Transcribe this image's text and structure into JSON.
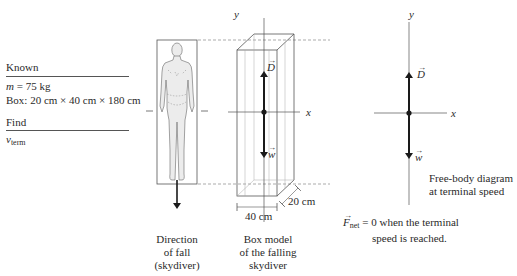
{
  "known_panel": {
    "heading": "Known",
    "mass_var": "m",
    "mass_value": " = 75 kg",
    "box_dims": "Box: 20 cm × 40 cm × 180 cm",
    "find_heading": "Find",
    "find_var": "v",
    "find_sub": "term"
  },
  "skydiver_figure": {
    "caption_line1": "Direction",
    "caption_line2": "of fall",
    "caption_line3": "(skydiver)"
  },
  "box_model": {
    "y_label": "y",
    "x_label": "x",
    "drag_label": "D",
    "weight_label": "w",
    "depth_label": "20 cm",
    "width_label": "40 cm",
    "caption_line1": "Box model",
    "caption_line2": "of the falling",
    "caption_line3": "skydiver"
  },
  "free_body": {
    "y_label": "y",
    "x_label": "x",
    "drag_label": "D",
    "weight_label": "w",
    "caption_line1": "Free-body diagram",
    "caption_line2": "at terminal speed",
    "net_force_var": "F",
    "net_force_sub": "net",
    "net_force_line1_rest": " = 0 when the terminal",
    "net_force_line2": "speed is reached."
  },
  "colors": {
    "line": "#555555",
    "arrow": "#1a1a1a",
    "dashed": "#888888",
    "body_fill": "#e6e6e6"
  }
}
